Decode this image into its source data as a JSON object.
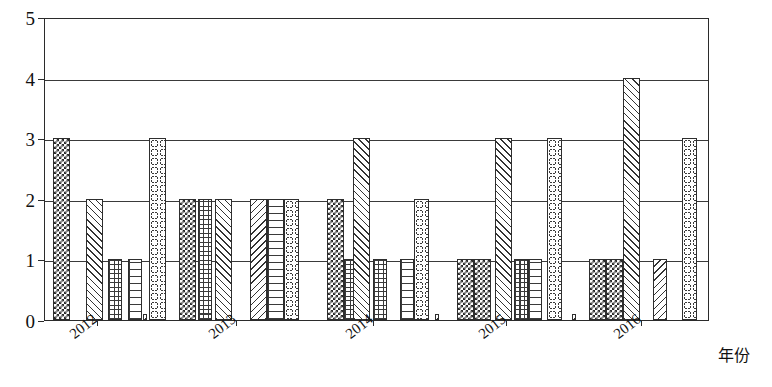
{
  "chart_data": {
    "type": "bar",
    "title": "",
    "subtitle": "",
    "xlabel": "年份",
    "ylabel": "",
    "ylim": [
      0,
      5
    ],
    "yticks": [
      0,
      1,
      2,
      3,
      4,
      5
    ],
    "grid": true,
    "legend": "none",
    "categories": [
      "2012",
      "2013",
      "2014",
      "2015",
      "2016"
    ],
    "series": [
      {
        "name": "系列1",
        "pattern": "checkerboard",
        "values": [
          3,
          2,
          2,
          1,
          1
        ]
      },
      {
        "name": "系列2",
        "pattern": "diagonal-hatch",
        "values": [
          2,
          2,
          1,
          3,
          4
        ]
      },
      {
        "name": "系列3",
        "pattern": "crosshatch-grid",
        "values": [
          1,
          2,
          1,
          1,
          1
        ]
      },
      {
        "name": "系列4",
        "pattern": "brick",
        "values": [
          1,
          2,
          1,
          1,
          1
        ]
      },
      {
        "name": "系列5",
        "pattern": "circles",
        "values": [
          3,
          2,
          2,
          3,
          3
        ]
      },
      {
        "name": "系列6",
        "pattern": "reverse-diagonal",
        "values": [
          0.1,
          2,
          0.1,
          0.1,
          0.1
        ]
      }
    ],
    "bars": [
      {
        "group": "2012",
        "index": 0,
        "value": 3,
        "pattern": "p-checker",
        "x": 52,
        "w": 17
      },
      {
        "group": "2012",
        "index": 1,
        "value": 2,
        "pattern": "p-diag",
        "x": 85,
        "w": 17
      },
      {
        "group": "2012",
        "index": 2,
        "value": 1,
        "pattern": "p-grid",
        "x": 107,
        "w": 14
      },
      {
        "group": "2012",
        "index": 3,
        "value": 1,
        "pattern": "p-brick",
        "x": 127,
        "w": 14
      },
      {
        "group": "2012",
        "index": 4,
        "value": 3,
        "pattern": "p-circle",
        "x": 148,
        "w": 17
      },
      {
        "group": "2012",
        "index": 5,
        "value": 0.1,
        "pattern": "p-diag-rev",
        "x": 142,
        "w": 4
      },
      {
        "group": "2013",
        "index": 0,
        "value": 2,
        "pattern": "p-checker",
        "x": 178,
        "w": 17
      },
      {
        "group": "2013",
        "index": 1,
        "value": 2,
        "pattern": "p-diag",
        "x": 214,
        "w": 17
      },
      {
        "group": "2013",
        "index": 2,
        "value": 2,
        "pattern": "p-diag-rev",
        "x": 249,
        "w": 17
      },
      {
        "group": "2013",
        "index": 3,
        "value": 2,
        "pattern": "p-brick",
        "x": 266,
        "w": 17
      },
      {
        "group": "2013",
        "index": 4,
        "value": 2,
        "pattern": "p-circle",
        "x": 283,
        "w": 15
      },
      {
        "group": "2013",
        "index": 5,
        "value": 2,
        "pattern": "p-grid",
        "x": 197,
        "w": 14
      },
      {
        "group": "2014",
        "index": 0,
        "value": 2,
        "pattern": "p-checker",
        "x": 326,
        "w": 17
      },
      {
        "group": "2014",
        "index": 1,
        "value": 1,
        "pattern": "p-grid",
        "x": 343,
        "w": 14
      },
      {
        "group": "2014",
        "index": 2,
        "value": 3,
        "pattern": "p-diag",
        "x": 352,
        "w": 17
      },
      {
        "group": "2014",
        "index": 3,
        "value": 1,
        "pattern": "p-grid",
        "x": 372,
        "w": 14
      },
      {
        "group": "2014",
        "index": 4,
        "value": 1,
        "pattern": "p-brick",
        "x": 399,
        "w": 14
      },
      {
        "group": "2014",
        "index": 5,
        "value": 2,
        "pattern": "p-circle",
        "x": 413,
        "w": 15
      },
      {
        "group": "2014",
        "index": 6,
        "value": 0.1,
        "pattern": "p-diag-rev",
        "x": 434,
        "w": 4
      },
      {
        "group": "2015",
        "index": 0,
        "value": 1,
        "pattern": "p-checker",
        "x": 456,
        "w": 17
      },
      {
        "group": "2015",
        "index": 1,
        "value": 1,
        "pattern": "p-checker",
        "x": 473,
        "w": 17
      },
      {
        "group": "2015",
        "index": 2,
        "value": 3,
        "pattern": "p-diag",
        "x": 494,
        "w": 17
      },
      {
        "group": "2015",
        "index": 3,
        "value": 1,
        "pattern": "p-grid",
        "x": 513,
        "w": 14
      },
      {
        "group": "2015",
        "index": 4,
        "value": 1,
        "pattern": "p-brick",
        "x": 527,
        "w": 14
      },
      {
        "group": "2015",
        "index": 5,
        "value": 3,
        "pattern": "p-circle",
        "x": 546,
        "w": 15
      },
      {
        "group": "2015",
        "index": 6,
        "value": 0.1,
        "pattern": "p-diag-rev",
        "x": 571,
        "w": 4
      },
      {
        "group": "2016",
        "index": 0,
        "value": 1,
        "pattern": "p-checker",
        "x": 588,
        "w": 17
      },
      {
        "group": "2016",
        "index": 1,
        "value": 1,
        "pattern": "p-checker",
        "x": 605,
        "w": 17
      },
      {
        "group": "2016",
        "index": 2,
        "value": 4,
        "pattern": "p-diag",
        "x": 622,
        "w": 17
      },
      {
        "group": "2016",
        "index": 3,
        "value": 1,
        "pattern": "p-diag-rev",
        "x": 652,
        "w": 14
      },
      {
        "group": "2016",
        "index": 4,
        "value": 3,
        "pattern": "p-circle",
        "x": 681,
        "w": 15
      }
    ]
  },
  "axis": {
    "y_tick_labels": [
      "0",
      "1",
      "2",
      "3",
      "4",
      "5"
    ],
    "x_tick_labels": [
      "2012",
      "2013",
      "2014",
      "2015",
      "2016"
    ],
    "x_axis_title": "年份"
  }
}
